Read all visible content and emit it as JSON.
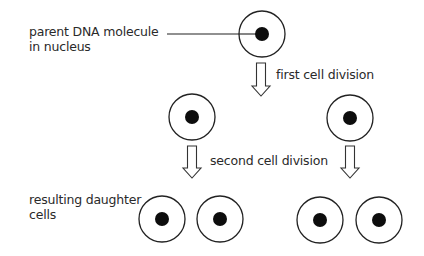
{
  "diagram": {
    "labels": {
      "parent_line1": "parent DNA molecule",
      "parent_line2": "in nucleus",
      "first_division": "first cell division",
      "second_division": "second cell division",
      "daughter_line1": "resulting daughter",
      "daughter_line2": "cells"
    },
    "generations": [
      {
        "name": "parent",
        "cells": [
          {
            "cx": 262,
            "cy": 34
          }
        ]
      },
      {
        "name": "after first division",
        "cells": [
          {
            "cx": 192,
            "cy": 117
          },
          {
            "cx": 350,
            "cy": 118
          }
        ]
      },
      {
        "name": "daughter cells",
        "cells": [
          {
            "cx": 162,
            "cy": 219
          },
          {
            "cx": 220,
            "cy": 219
          },
          {
            "cx": 320,
            "cy": 220
          },
          {
            "cx": 379,
            "cy": 220
          }
        ]
      }
    ],
    "cell_radius": 23,
    "nucleus_radius": 7,
    "colors": {
      "background": "#ffffff",
      "outline": "#222222",
      "nucleus": "#0d0d0d",
      "text": "#2a2a2a"
    }
  }
}
